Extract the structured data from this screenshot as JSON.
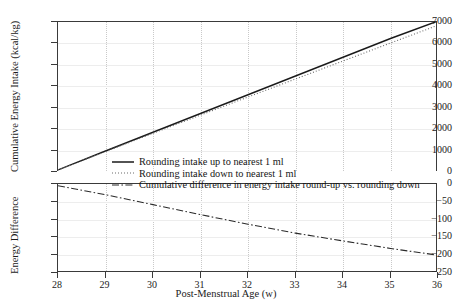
{
  "figure": {
    "top_partial_text": "",
    "x_axis_title": "Post-Menstrual Age (w)",
    "y_axis_title_top": "Cumulative Energy Intake (kcal/kg)",
    "y_axis_title_bottom": "Energy Difference"
  },
  "legend": {
    "items": [
      {
        "label": "Rounding intake up to nearest 1 ml",
        "style": "solid",
        "color": "#1a1a1a",
        "icon": "solid-line-swatch"
      },
      {
        "label": "Rounding intake down to nearest 1 ml",
        "style": "dotted",
        "color": "#6a6a6a",
        "icon": "dotted-line-swatch"
      },
      {
        "label": "Cumulative difference in energy intake round-up vs. rounding down",
        "style": "dashdot",
        "color": "#2a2a2a",
        "icon": "dashdot-line-swatch"
      }
    ]
  },
  "chart_data": {
    "type": "line",
    "title": "",
    "xlabel": "Post-Menstrual Age (w)",
    "x": [
      28,
      29,
      30,
      31,
      32,
      33,
      34,
      35,
      36
    ],
    "xlim": [
      28,
      36
    ],
    "xticks": [
      28,
      29,
      30,
      31,
      32,
      33,
      34,
      35,
      36
    ],
    "grid": true,
    "legend_position": "center",
    "panels": [
      {
        "name": "cumulative-energy-intake",
        "ylabel": "Cumulative Energy Intake (kcal/kg)",
        "ylim": [
          0,
          7000
        ],
        "yticks": [
          0,
          1000,
          2000,
          3000,
          4000,
          5000,
          6000,
          7000
        ],
        "series": [
          {
            "name": "Rounding intake up to nearest 1 ml",
            "style": "solid",
            "color": "#1a1a1a",
            "values": [
              100,
              980,
              1855,
              2730,
              3605,
              4480,
              5355,
              6230,
              7050
            ]
          },
          {
            "name": "Rounding intake down to nearest 1 ml",
            "style": "dotted",
            "color": "#6a6a6a",
            "values": [
              95,
              955,
              1805,
              2655,
              3500,
              4340,
              5180,
              6020,
              6850
            ]
          }
        ]
      },
      {
        "name": "energy-difference",
        "ylabel": "Energy Difference",
        "ylim": [
          -250,
          0
        ],
        "yticks": [
          0,
          -50,
          -100,
          -150,
          -200,
          -250
        ],
        "series": [
          {
            "name": "Cumulative difference in energy intake round-up vs. rounding down",
            "style": "dashdot",
            "color": "#2a2a2a",
            "values": [
              -5,
              -30,
              -58,
              -86,
              -113,
              -138,
              -160,
              -181,
              -200
            ]
          }
        ]
      }
    ]
  }
}
